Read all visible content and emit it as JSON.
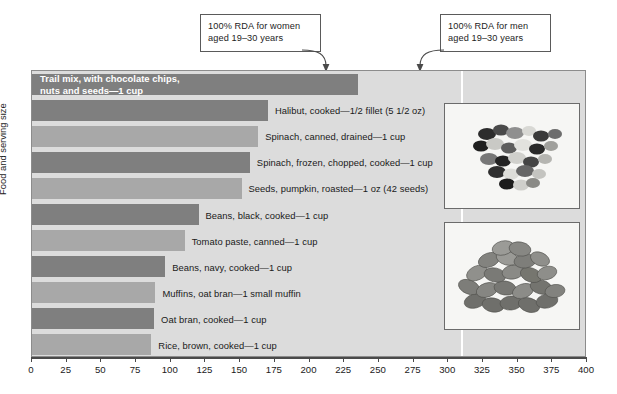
{
  "chart_data": {
    "type": "bar",
    "orientation": "horizontal",
    "title": "",
    "xlabel": "",
    "ylabel": "Food and serving size",
    "xlim": [
      0,
      400
    ],
    "xtick_step": 25,
    "grid": false,
    "legend": "none",
    "xticks": [
      "0",
      "25",
      "50",
      "75",
      "100",
      "125",
      "150",
      "175",
      "200",
      "225",
      "250",
      "275",
      "300",
      "325",
      "350",
      "375",
      "400"
    ],
    "categories": [
      "Trail mix, with chocolate chips,\nnuts and seeds—1 cup",
      "Halibut, cooked—1/2 fillet (5 1/2 oz)",
      "Spinach, canned, drained—1 cup",
      "Spinach, frozen, chopped, cooked—1 cup",
      "Seeds, pumpkin, roasted—1 oz (42 seeds)",
      "Beans, black, cooked—1 cup",
      "Tomato paste, canned—1 cup",
      "Beans, navy, cooked—1 cup",
      "Muffins, oat bran—1 small muffin",
      "Oat bran, cooked—1 cup",
      "Rice, brown, cooked—1 cup"
    ],
    "values": [
      235,
      170,
      163,
      157,
      151,
      120,
      110,
      96,
      89,
      88,
      86
    ],
    "bar_shades": [
      "dark",
      "dark",
      "light",
      "dark",
      "light",
      "dark",
      "light",
      "dark",
      "light",
      "dark",
      "light"
    ],
    "label_placement": [
      "inside",
      "outside",
      "outside",
      "outside",
      "outside",
      "outside",
      "outside",
      "outside",
      "outside",
      "outside",
      "outside"
    ],
    "reference_lines": [
      {
        "id": "women",
        "value": 310,
        "label": "100% RDA for women\naged 19–30 years"
      },
      {
        "id": "men",
        "value": 400,
        "label": "100% RDA for men\naged 19–30 years"
      }
    ],
    "colors": {
      "bar_dark": "#7f7f7f",
      "bar_light": "#a8a8a8",
      "plot_background": "#dcdcdc",
      "reference_line": "#ffffff",
      "axis": "#4a4a4a",
      "inside_label_text": "#ffffff"
    }
  },
  "insets": [
    {
      "name": "trail-mix-photo",
      "caption": ""
    },
    {
      "name": "pumpkin-seeds-photo",
      "caption": ""
    }
  ]
}
